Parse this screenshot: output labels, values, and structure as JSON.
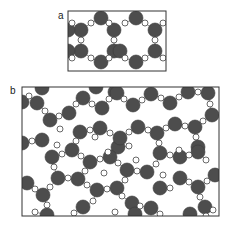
{
  "figure": {
    "panels": [
      {
        "id": "a",
        "label": "a",
        "label_pos": [
          58,
          19
        ],
        "frame": {
          "x": 68,
          "y": 11,
          "w": 98,
          "h": 60
        },
        "big_atom_color": "#4d4d4d",
        "small_atom_color": "#ffffff",
        "big_radius": 7,
        "small_radius": 3,
        "big_atoms": [
          [
            81,
            30
          ],
          [
            101,
            18
          ],
          [
            114,
            30
          ],
          [
            81,
            51
          ],
          [
            101,
            62
          ],
          [
            114,
            51
          ],
          [
            136,
            18
          ],
          [
            155,
            30
          ],
          [
            155,
            51
          ],
          [
            136,
            62
          ],
          [
            120,
            51
          ],
          [
            68,
            30
          ],
          [
            68,
            51
          ]
        ],
        "small_atoms": [
          [
            72,
            23
          ],
          [
            91,
            23
          ],
          [
            109,
            23
          ],
          [
            125,
            23
          ],
          [
            145,
            23
          ],
          [
            163,
            23
          ],
          [
            81,
            40
          ],
          [
            114,
            40
          ],
          [
            155,
            40
          ],
          [
            72,
            58
          ],
          [
            91,
            58
          ],
          [
            109,
            58
          ],
          [
            125,
            58
          ],
          [
            145,
            58
          ],
          [
            163,
            58
          ]
        ]
      },
      {
        "id": "b",
        "label": "b",
        "label_pos": [
          10,
          94
        ],
        "frame": {
          "x": 22,
          "y": 87,
          "w": 197,
          "h": 129
        },
        "big_atom_color": "#4d4d4d",
        "small_atom_color": "#ffffff",
        "big_radius": 7,
        "small_radius": 3,
        "big_atoms": [
          [
            22,
            102
          ],
          [
            37,
            103
          ],
          [
            50,
            120
          ],
          [
            69,
            113
          ],
          [
            83,
            98
          ],
          [
            102,
            108
          ],
          [
            115,
            92
          ],
          [
            80,
            132
          ],
          [
            100,
            128
          ],
          [
            42,
            140
          ],
          [
            22,
            143
          ],
          [
            72,
            150
          ],
          [
            118,
            147
          ],
          [
            117,
            93
          ],
          [
            133,
            105
          ],
          [
            151,
            94
          ],
          [
            170,
            103
          ],
          [
            188,
            92
          ],
          [
            208,
            93
          ],
          [
            212,
            115
          ],
          [
            195,
            127
          ],
          [
            175,
            124
          ],
          [
            157,
            133
          ],
          [
            138,
            127
          ],
          [
            120,
            138
          ],
          [
            198,
            147
          ],
          [
            160,
            153
          ],
          [
            52,
            157
          ],
          [
            90,
            162
          ],
          [
            110,
            157
          ],
          [
            58,
            178
          ],
          [
            78,
            179
          ],
          [
            27,
            183
          ],
          [
            43,
            195
          ],
          [
            97,
            190
          ],
          [
            117,
            188
          ],
          [
            83,
            207
          ],
          [
            47,
            215
          ],
          [
            180,
            157
          ],
          [
            198,
            152
          ],
          [
            215,
            175
          ],
          [
            127,
            170
          ],
          [
            147,
            172
          ],
          [
            180,
            178
          ],
          [
            198,
            187
          ],
          [
            160,
            188
          ],
          [
            132,
            203
          ],
          [
            151,
            208
          ],
          [
            205,
            207
          ],
          [
            42,
            88
          ],
          [
            96,
            87
          ],
          [
            135,
            214
          ],
          [
            190,
            214
          ]
        ],
        "small_atoms": [
          [
            29,
            96
          ],
          [
            45,
            111
          ],
          [
            59,
            116
          ],
          [
            76,
            104
          ],
          [
            92,
            104
          ],
          [
            109,
            99
          ],
          [
            124,
            99
          ],
          [
            142,
            100
          ],
          [
            161,
            98
          ],
          [
            179,
            97
          ],
          [
            198,
            92
          ],
          [
            210,
            104
          ],
          [
            203,
            121
          ],
          [
            185,
            126
          ],
          [
            166,
            128
          ],
          [
            148,
            130
          ],
          [
            129,
            132
          ],
          [
            110,
            133
          ],
          [
            90,
            130
          ],
          [
            60,
            129
          ],
          [
            32,
            141
          ],
          [
            57,
            145
          ],
          [
            76,
            141
          ],
          [
            95,
            137
          ],
          [
            108,
            152
          ],
          [
            129,
            146
          ],
          [
            159,
            143
          ],
          [
            196,
            137
          ],
          [
            179,
            150
          ],
          [
            206,
            160
          ],
          [
            189,
            155
          ],
          [
            170,
            155
          ],
          [
            136,
            160
          ],
          [
            118,
            163
          ],
          [
            100,
            159
          ],
          [
            81,
            156
          ],
          [
            62,
            154
          ],
          [
            54,
            167
          ],
          [
            68,
            178
          ],
          [
            85,
            171
          ],
          [
            104,
            173
          ],
          [
            137,
            171
          ],
          [
            156,
            164
          ],
          [
            163,
            175
          ],
          [
            189,
            182
          ],
          [
            207,
            181
          ],
          [
            35,
            189
          ],
          [
            50,
            187
          ],
          [
            87,
            185
          ],
          [
            107,
            189
          ],
          [
            125,
            180
          ],
          [
            122,
            196
          ],
          [
            140,
            206
          ],
          [
            170,
            188
          ],
          [
            200,
            197
          ],
          [
            93,
            201
          ],
          [
            74,
            213
          ],
          [
            47,
            205
          ],
          [
            35,
            212
          ],
          [
            160,
            214
          ],
          [
            206,
            216
          ],
          [
            213,
            210
          ],
          [
            115,
            212
          ]
        ]
      }
    ]
  }
}
